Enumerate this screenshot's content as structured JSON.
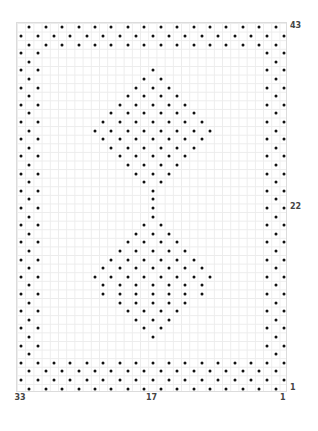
{
  "chart_pattern": {
    "columns": 33,
    "rows": 43,
    "dot_color": "#111111",
    "grid_color": "#ececec",
    "border_color": "#dcdcdc",
    "row_labels": [
      {
        "text": "43",
        "row": 43
      },
      {
        "text": "22",
        "row": 22
      },
      {
        "text": "1",
        "row": 1
      }
    ],
    "column_labels": [
      {
        "text": "33",
        "col": 33
      },
      {
        "text": "17",
        "col": 17
      },
      {
        "text": "1",
        "col": 1
      }
    ],
    "grid_rows_top_to_bottom": [
      ".X.X.X.X.X.X.X.X.X.X.X.X.X.X.X.X.",
      "X.X.X.X.X.X.X.X.X.X.X.X.X.X.X.X.X",
      ".X.X.X.X.X.X.X.X.X.X.X.X.X.X.X.X.",
      "X.X...........................X.X",
      ".X.............................X.",
      "X.X.............X.............X.X",
      ".X.............X.X.............X.",
      "X.X...........X.X.X...........X.X",
      ".X...........X.X.X.X...........X.",
      "X.X.........X.X.X.X.X.........X.X",
      ".X.........X.X.X.X.X.X.........X.",
      "X.X.......X.X.X.X.X.X.X.......X.X",
      ".X.......X.X.X.X.X.X.X.X.......X.",
      "X.X.......X.X.X.X.X.X.X.......X.X",
      ".X.........X.X.X.X.X.X.........X.",
      "X.X.........X.X.X.X.X.........X.X",
      ".X...........X.X.X.X...........X.",
      "X.X...........X.X.X...........X.X",
      ".X.............X.X.............X.",
      "X.X.............X.............X.X",
      ".X..............X..............X.",
      "X.X.............X.............X.X",
      ".X..............X..............X.",
      "X.X............X.X............X.X",
      ".X............X.X.X............X.",
      "X.X..........X.X.X.X..........X.X",
      ".X..........X.X.X.X.X..........X.",
      "X.X........X.X.X.X.X.X........X.X",
      ".X........X.X.X.X.X.X.X........X.",
      "X.X......X.X.X.X.X.X.X.X......X.X",
      ".X........X.X.X.X.X.X.X........X.",
      "X.X.......X.X.X.X.X.X.X.......X.X",
      ".X..........X.X.X.X.X..........X.",
      "X.X..........X.X.X.X..........X.X",
      ".X............X.X.X............X.",
      "X.X............X.X............X.X",
      ".X..............X..............X.",
      "X.X...........................X.X",
      ".X.............................X.",
      "X.X.X.X.X.X.X.X.X.X.X.X.X.X.X.X.X",
      ".X.X.X.X.X.X.X.X.X.X.X.X.X.X.X.X.",
      "X.X.X.X.X.X.X.X.X.X.X.X.X.X.X.X.X",
      ".X.X.X.X.X.X.X.X.X.X.X.X.X.X.X.X."
    ]
  }
}
